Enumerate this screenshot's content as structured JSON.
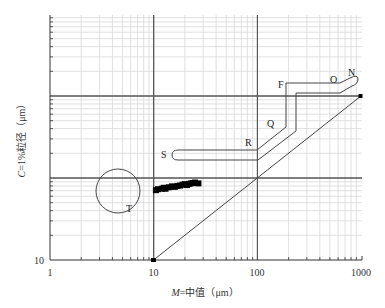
{
  "chart_data": {
    "type": "scatter",
    "title": "",
    "xlabel": "M=中值（μm）",
    "ylabel": "C=1%粒径（μm）",
    "xscale": "log",
    "yscale": "log",
    "xlim": [
      1,
      1000
    ],
    "ylim": [
      10,
      10000
    ],
    "x_tick_labels": [
      "1",
      "10",
      "100",
      "1000"
    ],
    "y_tick_labels": [
      "10"
    ],
    "grid": true,
    "reference_line": {
      "name": "C=M",
      "points": [
        [
          10,
          10
        ],
        [
          1000,
          1000
        ]
      ]
    },
    "segment_labels": [
      "N",
      "O",
      "F",
      "Q",
      "R",
      "S",
      "T"
    ],
    "series": [
      {
        "name": "samples",
        "points": [
          [
            10.5,
            71
          ],
          [
            11,
            73
          ],
          [
            12,
            74
          ],
          [
            12.5,
            76
          ],
          [
            13,
            74
          ],
          [
            14,
            77
          ],
          [
            15,
            79
          ],
          [
            16,
            78
          ],
          [
            17,
            80
          ],
          [
            18,
            81
          ],
          [
            19,
            83
          ],
          [
            20,
            84
          ],
          [
            21,
            82
          ],
          [
            22,
            85
          ],
          [
            23,
            86
          ],
          [
            24,
            87
          ],
          [
            25,
            88
          ],
          [
            27,
            86
          ]
        ]
      }
    ],
    "pattern_regions": [
      {
        "label": "NOPQRS boundary",
        "description": "Passega C-M pattern segments N-O-F-Q-R-S"
      },
      {
        "label": "T",
        "description": "Circle zone T centered near M≈4.5 μm, C≈80 μm"
      }
    ]
  },
  "axes": {
    "x_labels": [
      "1",
      "10",
      "100",
      "1000"
    ],
    "y_labels": [
      "10"
    ],
    "x_title_italic": "M",
    "x_title_rest": "=中值（μm）",
    "y_title_italic": "C",
    "y_title_rest": "=1%粒径（μm）"
  },
  "labels": {
    "N": "N",
    "O": "O",
    "F": "F",
    "Q": "Q",
    "R": "R",
    "S": "S",
    "T": "T"
  },
  "colors": {
    "axis": "#333333",
    "major_grid": "#555555",
    "minor_grid": "#d8d8d8",
    "line": "#444444",
    "points": "#000000"
  }
}
